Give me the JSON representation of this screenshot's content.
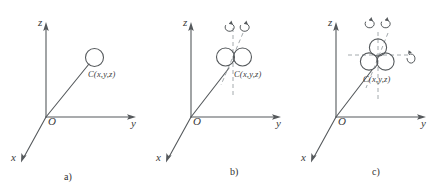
{
  "figure": {
    "background_color": "#ffffff",
    "stroke_color": "#55595c",
    "text_color": "#3a3a3a",
    "width": 435,
    "height": 191
  },
  "panels": [
    {
      "id": "a",
      "caption": "a)",
      "axes": {
        "z_label": "z",
        "y_label": "y",
        "x_label": "x",
        "origin_label": "O"
      },
      "point": {
        "label": "C(x,y,z)"
      },
      "circles": 1,
      "rotation_arrows": 0,
      "dashed_guides": 0
    },
    {
      "id": "b",
      "caption": "b)",
      "axes": {
        "z_label": "z",
        "y_label": "y",
        "x_label": "x",
        "origin_label": "O"
      },
      "point": {
        "label": "C(x,y,z)"
      },
      "circles": 2,
      "rotation_arrows": 2,
      "dashed_guides": 2
    },
    {
      "id": "c",
      "caption": "c)",
      "axes": {
        "z_label": "z",
        "y_label": "y",
        "x_label": "x",
        "origin_label": "O"
      },
      "point": {
        "label": "C(x,y,z)"
      },
      "circles": 3,
      "rotation_arrows": 3,
      "dashed_guides": 3
    }
  ]
}
